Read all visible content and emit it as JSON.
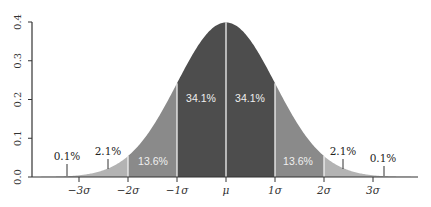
{
  "chart_data": {
    "type": "area",
    "title": "",
    "xlabel": "",
    "ylabel": "",
    "ylim": [
      0.0,
      0.4
    ],
    "yticks": [
      "0.0",
      "0.1",
      "0.2",
      "0.3",
      "0.4"
    ],
    "xticks": [
      "−3σ",
      "−2σ",
      "−1σ",
      "μ",
      "1σ",
      "2σ",
      "3σ"
    ],
    "grid": false,
    "legend": null,
    "regions": [
      {
        "range": "< -3σ",
        "label": "0.1%",
        "value": 0.1
      },
      {
        "range": "-3σ to -2σ",
        "label": "2.1%",
        "value": 2.1
      },
      {
        "range": "-2σ to -1σ",
        "label": "13.6%",
        "value": 13.6
      },
      {
        "range": "-1σ to μ",
        "label": "34.1%",
        "value": 34.1
      },
      {
        "range": "μ to 1σ",
        "label": "34.1%",
        "value": 34.1
      },
      {
        "range": "1σ to 2σ",
        "label": "13.6%",
        "value": 13.6
      },
      {
        "range": "2σ to 3σ",
        "label": "2.1%",
        "value": 2.1
      },
      {
        "range": "> 3σ",
        "label": "0.1%",
        "value": 0.1
      }
    ],
    "colors": {
      "dark": "#4d4d4d",
      "medium": "#8a8a8a",
      "light": "#b3b3b3",
      "divider": "#f2f2f2",
      "axis": "#333333"
    }
  }
}
